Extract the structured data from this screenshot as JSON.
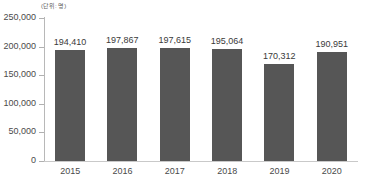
{
  "chart_data": {
    "type": "bar",
    "title": "",
    "subtitle": "",
    "unit_label": "(단위: 명)",
    "categories": [
      "2015",
      "2016",
      "2017",
      "2018",
      "2019",
      "2020"
    ],
    "values": [
      194410,
      197867,
      197615,
      195064,
      170312,
      190951
    ],
    "value_labels": [
      "194,410",
      "197,867",
      "197,615",
      "195,064",
      "170,312",
      "190,951"
    ],
    "series": [
      {
        "name": "",
        "values": [
          194410,
          197867,
          197615,
          195064,
          170312,
          190951
        ]
      }
    ],
    "xlabel": "",
    "ylabel": "",
    "ylim": [
      0,
      250000
    ],
    "y_ticks": [
      0,
      50000,
      100000,
      150000,
      200000,
      250000
    ],
    "y_tick_labels": [
      "0",
      "50,000",
      "100,000",
      "150,000",
      "200,000",
      "250,000"
    ],
    "grid": false,
    "legend": null,
    "legend_position": "none",
    "bar_color": "#565656",
    "axis_color": "#b8b8b8",
    "text_color": "#3a3a3a",
    "background_color": "#ffffff"
  }
}
